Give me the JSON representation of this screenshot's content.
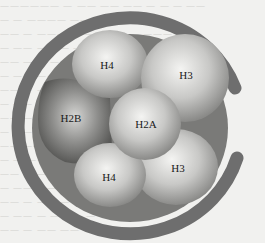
{
  "diagram": {
    "dna_color": "#6e6e6e",
    "subunits": [
      {
        "id": "h4_top",
        "label": "H4",
        "x": 107,
        "y": 65
      },
      {
        "id": "h3_top",
        "label": "H3",
        "x": 186,
        "y": 75
      },
      {
        "id": "h2b",
        "label": "H2B",
        "x": 71,
        "y": 118
      },
      {
        "id": "h2a",
        "label": "H2A",
        "x": 146,
        "y": 124
      },
      {
        "id": "h3_bottom",
        "label": "H3",
        "x": 178,
        "y": 168
      },
      {
        "id": "h4_bottom",
        "label": "H4",
        "x": 109,
        "y": 177
      }
    ]
  },
  "background_text": [
    "一一一一一一 一 一一 一一 一一 一 一 一 一一",
    "一 一 一一一一 一一 一 一一 一 一一一",
    "一一 一 一一一 一 一一 一一 一 一一一",
    "一 一一 一 一一 一 一一 一 一一 一一",
    "一一 一 一 一 一一 一一 一 一 一一一",
    "一 一一 一一 一 一一 一 一一 一 一",
    "一一 一 一一 一 一 一一 一一 一一",
    "一 一一 一 一一 一一 一 一 一一一",
    "一一 一 一一 一 一一 一一 一 一一",
    "一 一一 一 一 一一 一 一一 一一一",
    "一一 一一 一 一一 一 一 一一 一一",
    "一 一 一一 一一 一 一一 一 一一一",
    "一一 一 一 一一 一一 一 一一 一一",
    "一 一一 一一 一 一 一一 一 一一一",
    "一一 一 一一 一 一一 一一 一 一一",
    "一 一一 一 一一 一 一 一一 一一一",
    "一一 一 一一 一一 一 一一 一 一一"
  ]
}
